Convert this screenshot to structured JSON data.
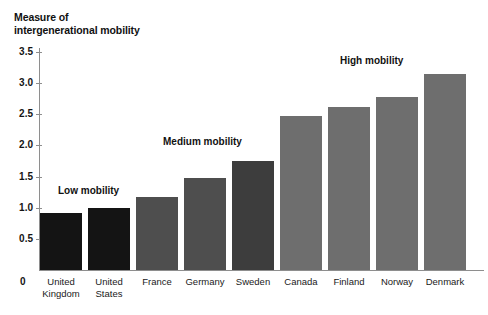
{
  "chart_data": {
    "type": "bar",
    "title": "Measure of\nintergenerational mobility",
    "xlabel": "",
    "ylabel": "Measure of intergenerational mobility",
    "ylim": [
      0,
      3.5
    ],
    "grid": false,
    "legend": "none",
    "categories": [
      "United\nKingdom",
      "United\nStates",
      "France",
      "Germany",
      "Sweden",
      "Canada",
      "Finland",
      "Norway",
      "Denmark"
    ],
    "values": [
      0.92,
      1.0,
      1.17,
      1.47,
      1.75,
      2.48,
      2.62,
      2.78,
      3.15
    ],
    "bar_colors": [
      "#141414",
      "#141414",
      "#4e4e4e",
      "#4e4e4e",
      "#3d3d3d",
      "#6e6e6e",
      "#6e6e6e",
      "#6e6e6e",
      "#6e6e6e"
    ],
    "yticks": [
      0.5,
      1.0,
      1.5,
      2.0,
      2.5,
      3.0,
      3.5
    ],
    "ytick_labels": [
      "0.5",
      "1.0",
      "1.5",
      "2.0",
      "2.5",
      "3.0",
      "3.5"
    ],
    "origin_label": "0",
    "annotations": [
      {
        "text": "Low mobility",
        "x": 58,
        "y": 185
      },
      {
        "text": "Medium mobility",
        "x": 163,
        "y": 136
      },
      {
        "text": "High mobility",
        "x": 340,
        "y": 55
      }
    ]
  },
  "colors": {
    "axis": "#8e8e8e",
    "text": "#111111",
    "background": "#ffffff",
    "bar_dark": "#141414",
    "bar_medium": "#4e4e4e",
    "bar_light": "#6e6e6e"
  }
}
